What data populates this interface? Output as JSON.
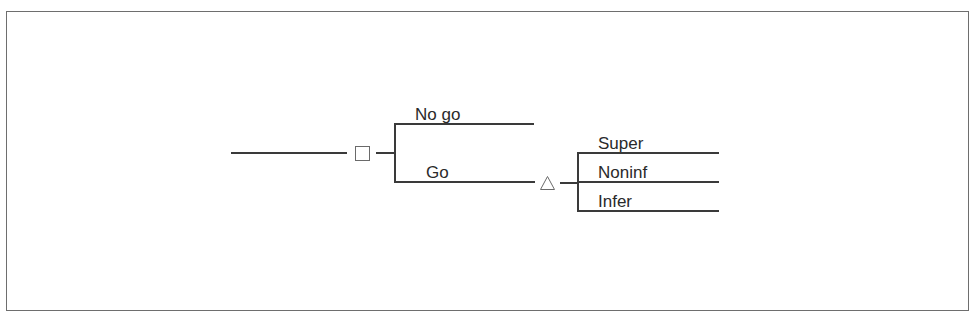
{
  "diagram": {
    "type": "decision-tree",
    "decision_node": {
      "shape": "square",
      "icon": "decision-square-icon"
    },
    "chance_node": {
      "shape": "triangle",
      "icon": "chance-triangle-icon"
    },
    "decision_branches": [
      {
        "label": "No go"
      },
      {
        "label": "Go"
      }
    ],
    "chance_outcomes": [
      {
        "label": "Super"
      },
      {
        "label": "Noninf"
      },
      {
        "label": "Infer"
      }
    ],
    "colors": {
      "line": "#3a3a3a",
      "node_border": "#6a6a6a",
      "frame": "#6e6e6e",
      "text": "#2a2a2a"
    }
  }
}
